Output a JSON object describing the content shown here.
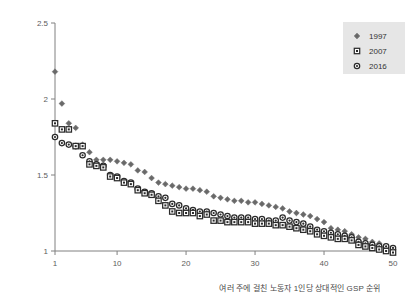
{
  "chart_data": {
    "type": "scatter",
    "title": "",
    "xlabel": "여러 주에 걸친 노동자 1인당 상대적인 GSP 순위",
    "ylabel": "노동자 1인당 GSP (최소치 대비)",
    "xlim": [
      1,
      50
    ],
    "ylim": [
      1,
      2.5
    ],
    "xticks": [
      1,
      10,
      20,
      30,
      40,
      50
    ],
    "yticks": [
      1,
      1.5,
      2,
      2.5
    ],
    "xtick_labels": [
      "1",
      "10",
      "20",
      "30",
      "40",
      "50"
    ],
    "ytick_labels": [
      "1",
      "1.5",
      "2",
      "2.5"
    ],
    "grid": false,
    "legend_position": "top-right",
    "x": [
      1,
      2,
      3,
      4,
      5,
      6,
      7,
      8,
      9,
      10,
      11,
      12,
      13,
      14,
      15,
      16,
      17,
      18,
      19,
      20,
      21,
      22,
      23,
      24,
      25,
      26,
      27,
      28,
      29,
      30,
      31,
      32,
      33,
      34,
      35,
      36,
      37,
      38,
      39,
      40,
      41,
      42,
      43,
      44,
      45,
      46,
      47,
      48,
      49,
      50
    ],
    "series": [
      {
        "name": "1997",
        "marker": "diamond",
        "color": "#6e6e6e",
        "values": [
          2.18,
          1.97,
          1.84,
          1.81,
          1.7,
          1.65,
          1.6,
          1.6,
          1.6,
          1.59,
          1.58,
          1.57,
          1.53,
          1.52,
          1.48,
          1.45,
          1.44,
          1.43,
          1.42,
          1.41,
          1.41,
          1.4,
          1.39,
          1.36,
          1.35,
          1.34,
          1.33,
          1.33,
          1.32,
          1.32,
          1.31,
          1.3,
          1.29,
          1.28,
          1.26,
          1.25,
          1.24,
          1.23,
          1.21,
          1.19,
          1.15,
          1.14,
          1.13,
          1.11,
          1.09,
          1.08,
          1.06,
          1.05,
          1.03,
          1.01
        ]
      },
      {
        "name": "2007",
        "marker": "square",
        "color": "#2b2b2b",
        "values": [
          1.84,
          1.8,
          1.8,
          1.69,
          1.69,
          1.57,
          1.56,
          1.55,
          1.49,
          1.48,
          1.45,
          1.44,
          1.4,
          1.38,
          1.37,
          1.33,
          1.3,
          1.26,
          1.25,
          1.25,
          1.25,
          1.23,
          1.24,
          1.2,
          1.2,
          1.19,
          1.19,
          1.19,
          1.19,
          1.18,
          1.18,
          1.18,
          1.17,
          1.17,
          1.16,
          1.15,
          1.14,
          1.13,
          1.11,
          1.1,
          1.09,
          1.08,
          1.08,
          1.07,
          1.04,
          1.03,
          1.02,
          1.01,
          1.0,
          0.99
        ]
      },
      {
        "name": "2016",
        "marker": "circle",
        "color": "#2b2b2b",
        "values": [
          1.75,
          1.71,
          1.7,
          1.69,
          1.63,
          1.59,
          1.57,
          1.56,
          1.5,
          1.49,
          1.46,
          1.45,
          1.41,
          1.39,
          1.38,
          1.36,
          1.35,
          1.31,
          1.3,
          1.28,
          1.27,
          1.26,
          1.26,
          1.25,
          1.24,
          1.23,
          1.22,
          1.22,
          1.22,
          1.21,
          1.21,
          1.2,
          1.2,
          1.22,
          1.2,
          1.19,
          1.18,
          1.16,
          1.14,
          1.13,
          1.12,
          1.11,
          1.1,
          1.09,
          1.06,
          1.05,
          1.04,
          1.03,
          1.03,
          1.02
        ]
      }
    ]
  },
  "legend": {
    "items": [
      {
        "label": "1997",
        "marker": "diamond"
      },
      {
        "label": "2007",
        "marker": "square"
      },
      {
        "label": "2016",
        "marker": "circle"
      }
    ],
    "background": "#e6e6e6"
  },
  "axes": {
    "y_title": "노동자 1인당 GSP (최소치 대비)",
    "x_title": "여러 주에 걸친 노동자 1인당 상대적인 GSP 순위"
  }
}
